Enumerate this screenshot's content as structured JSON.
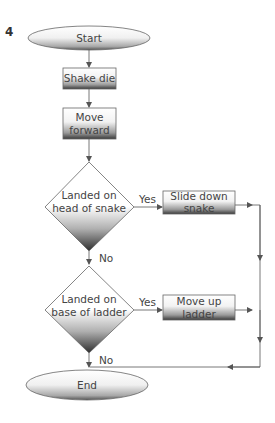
{
  "figure_number": "4",
  "nodes": {
    "start": {
      "label": "Start",
      "shape": "terminator"
    },
    "shake": {
      "label": "Shake die",
      "shape": "process"
    },
    "move": {
      "line1": "Move",
      "line2": "forward",
      "shape": "process"
    },
    "snake_decision": {
      "line1": "Landed on",
      "line2": "head of snake",
      "shape": "decision"
    },
    "slide": {
      "line1": "Slide down",
      "line2": "snake",
      "shape": "process"
    },
    "ladder_decision": {
      "line1": "Landed on",
      "line2": "base of ladder",
      "shape": "decision"
    },
    "climb": {
      "line1": "Move up",
      "line2": "ladder",
      "shape": "process"
    },
    "end": {
      "label": "End",
      "shape": "terminator"
    }
  },
  "edge_labels": {
    "snake_yes": "Yes",
    "snake_no": "No",
    "ladder_yes": "Yes",
    "ladder_no": "No"
  },
  "colors": {
    "stroke": "#555555",
    "fill_top": "#ffffff",
    "fill_bottom": "#3a3a3a",
    "text": "#444444"
  }
}
